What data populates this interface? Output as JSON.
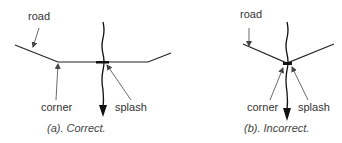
{
  "panels": [
    {
      "id": "a",
      "caption": "(a).  Correct.",
      "labels": {
        "road": "road",
        "corner": "corner",
        "splash": "splash"
      }
    },
    {
      "id": "b",
      "caption": "(b).  Incorrect.",
      "labels": {
        "road": "road",
        "corner": "corner",
        "splash": "splash"
      }
    }
  ],
  "colors": {
    "line": "#222222",
    "label_arrow": "#555555"
  }
}
